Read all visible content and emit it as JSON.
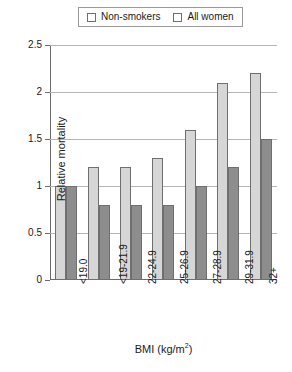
{
  "chart_data": {
    "type": "bar",
    "title": "",
    "xlabel": "BMI (kg/m2)",
    "xlabel_base": "BMI (kg/m",
    "xlabel_exponent": "2",
    "xlabel_suffix": ")",
    "ylabel": "Relative mortality",
    "ylim": [
      0,
      2.5
    ],
    "ytick_values": [
      0,
      0.5,
      1,
      1.5,
      2,
      2.5
    ],
    "ytick_labels": [
      "0",
      "0.5",
      "1",
      "1.5",
      "2",
      "2.5"
    ],
    "grid": true,
    "legend_position": "top-center",
    "categories": [
      "<19.0",
      "<19-21.9",
      "22-24.9",
      "25-26.9",
      "27-28.9",
      "29-31.9",
      "32+"
    ],
    "series": [
      {
        "name": "Non-smokers",
        "color": "#d6d6d6",
        "values": [
          1.0,
          1.2,
          1.2,
          1.3,
          1.6,
          2.1,
          2.2
        ]
      },
      {
        "name": "All women",
        "color": "#8d8d8d",
        "values": [
          1.0,
          0.8,
          0.8,
          0.8,
          1.0,
          1.2,
          1.5
        ]
      }
    ]
  },
  "legend": {
    "items": [
      {
        "label": "Non-smokers",
        "color": "#d6d6d6"
      },
      {
        "label": "All women",
        "color": "#8d8d8d"
      }
    ]
  },
  "colors": {
    "series_light": "#d6d6d6",
    "series_dark": "#8d8d8d",
    "axis": "#6b6b6b",
    "grid": "#b5b5b5",
    "bar_border": "#6f6f6f",
    "background": "#ffffff"
  }
}
